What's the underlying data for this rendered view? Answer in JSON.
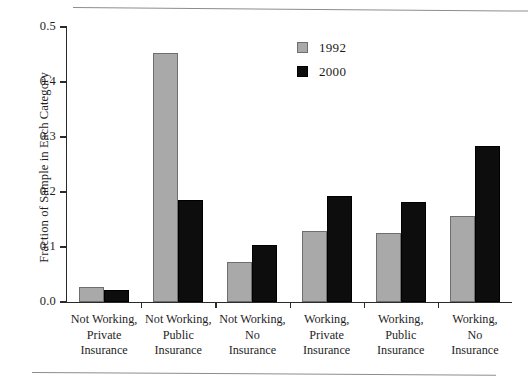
{
  "chart_data": {
    "type": "bar",
    "title": "",
    "xlabel": "",
    "ylabel": "Fraction of Sample in Each Category",
    "ylim": [
      0.0,
      0.5
    ],
    "yticks": [
      "0.0",
      "0.1",
      "0.2",
      "0.3",
      "0.4",
      "0.5"
    ],
    "ytick_values": [
      0.0,
      0.1,
      0.2,
      0.3,
      0.4,
      0.5
    ],
    "grid": false,
    "legend_position": "top-center",
    "categories": [
      "Not Working,\nPrivate\nInsurance",
      "Not Working,\nPublic\nInsurance",
      "Not Working,\nNo\nInsurance",
      "Working,\nPrivate\nInsurance",
      "Working,\nPublic\nInsurance",
      "Working,\nNo\nInsurance"
    ],
    "category_lines": [
      [
        "Not Working,",
        "Private",
        "Insurance"
      ],
      [
        "Not Working,",
        "Public",
        "Insurance"
      ],
      [
        "Not Working,",
        "No",
        "Insurance"
      ],
      [
        "Working,",
        "Private",
        "Insurance"
      ],
      [
        "Working,",
        "Public",
        "Insurance"
      ],
      [
        "Working,",
        "No",
        "Insurance"
      ]
    ],
    "series": [
      {
        "name": "1992",
        "color": "#a9a9a9",
        "values": [
          0.027,
          0.453,
          0.073,
          0.129,
          0.125,
          0.157
        ]
      },
      {
        "name": "2000",
        "color": "#0d0d0d",
        "values": [
          0.022,
          0.185,
          0.104,
          0.192,
          0.181,
          0.283
        ]
      }
    ]
  },
  "legend": {
    "entries": [
      {
        "label": "1992",
        "swatch": "gray-swatch"
      },
      {
        "label": "2000",
        "swatch": "black-swatch"
      }
    ]
  },
  "axes": {
    "y_title": "Fraction of Sample in Each Category"
  }
}
